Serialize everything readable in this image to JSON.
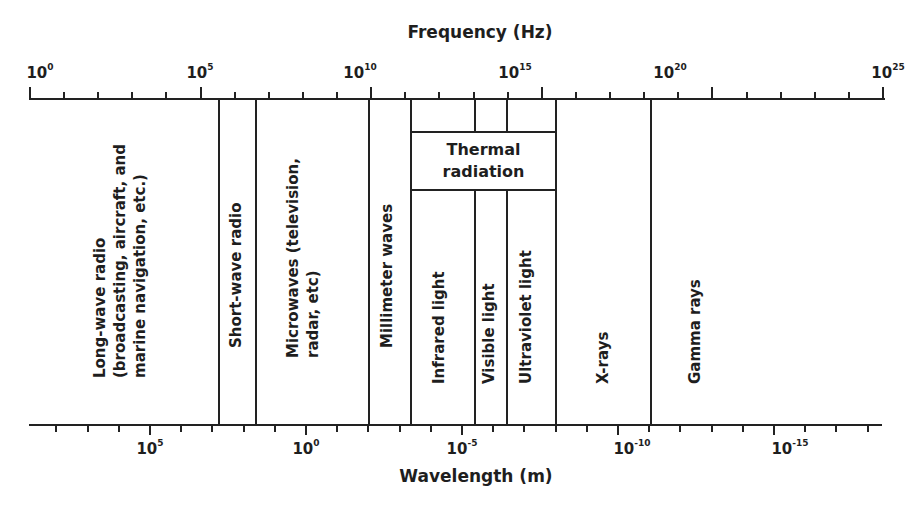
{
  "chart_data": {
    "type": "diagram",
    "top_axis": {
      "label": "Frequency (Hz)",
      "scale": "log10",
      "range": [
        0,
        25
      ],
      "ticks": [
        {
          "base": "10",
          "exp": "0",
          "value": 0
        },
        {
          "base": "10",
          "exp": "5",
          "value": 5
        },
        {
          "base": "10",
          "exp": "10",
          "value": 10
        },
        {
          "base": "10",
          "exp": "15",
          "value": 15
        },
        {
          "base": "10",
          "exp": "20",
          "value": 20
        },
        {
          "base": "10",
          "exp": "25",
          "value": 25
        }
      ]
    },
    "bottom_axis": {
      "label": "Wavelength (m)",
      "scale": "log10",
      "ticks": [
        {
          "base": "10",
          "exp": "5",
          "value": 5
        },
        {
          "base": "10",
          "exp": "0",
          "value": 0
        },
        {
          "base": "10",
          "exp": "-5",
          "value": -5
        },
        {
          "base": "10",
          "exp": "-10",
          "value": -10
        },
        {
          "base": "10",
          "exp": "-15",
          "value": -15
        }
      ]
    },
    "bands": [
      {
        "name": "Long-wave radio",
        "lines": [
          "Long-wave radio",
          "(broadcasting, aircraft, and",
          "marine navigation, etc.)"
        ],
        "freq_log10_range": [
          0,
          5.8
        ]
      },
      {
        "name": "Short-wave radio",
        "lines": [
          "Short-wave radio"
        ],
        "freq_log10_range": [
          5.8,
          6.9
        ]
      },
      {
        "name": "Microwaves",
        "lines": [
          "Microwaves (television,",
          "radar, etc)"
        ],
        "freq_log10_range": [
          6.9,
          10.2
        ]
      },
      {
        "name": "Millimeter waves",
        "lines": [
          "Millimeter waves"
        ],
        "freq_log10_range": [
          10.2,
          11.5
        ]
      },
      {
        "name": "Infrared light",
        "lines": [
          "Infrared light"
        ],
        "freq_log10_range": [
          11.5,
          13.4
        ]
      },
      {
        "name": "Visible light",
        "lines": [
          "Visible light"
        ],
        "freq_log10_range": [
          13.4,
          14.3
        ]
      },
      {
        "name": "Ultraviolet light",
        "lines": [
          "Ultraviolet light"
        ],
        "freq_log10_range": [
          14.3,
          15.8
        ]
      },
      {
        "name": "X-rays",
        "lines": [
          "X-rays"
        ],
        "freq_log10_range": [
          15.8,
          18.6
        ]
      },
      {
        "name": "Gamma rays",
        "lines": [
          "Gamma rays"
        ],
        "freq_log10_range": [
          18.6,
          25
        ]
      }
    ],
    "group": {
      "name": "Thermal radiation",
      "lines": [
        "Thermal",
        "radiation"
      ],
      "spans": [
        "Infrared light",
        "Visible light",
        "Ultraviolet light"
      ]
    }
  },
  "labels": {
    "freq_title": "Frequency (Hz)",
    "wave_title": "Wavelength (m)",
    "thermal_1": "Thermal",
    "thermal_2": "radiation",
    "lw_1": "Long-wave radio",
    "lw_2": "(broadcasting, aircraft, and",
    "lw_3": "marine navigation, etc.)",
    "sw": "Short-wave radio",
    "mw_1": "Microwaves (television,",
    "mw_2": "radar, etc)",
    "mm": "Millimeter waves",
    "ir": "Infrared light",
    "vis": "Visible light",
    "uv": "Ultraviolet light",
    "xr": "X-rays",
    "gr": "Gamma rays"
  },
  "ticks_top": [
    {
      "base": "10",
      "exp": "0"
    },
    {
      "base": "10",
      "exp": "5"
    },
    {
      "base": "10",
      "exp": "10"
    },
    {
      "base": "10",
      "exp": "15"
    },
    {
      "base": "10",
      "exp": "20"
    },
    {
      "base": "10",
      "exp": "25"
    }
  ],
  "ticks_bottom": [
    {
      "base": "10",
      "exp": "5"
    },
    {
      "base": "10",
      "exp": "0"
    },
    {
      "base": "10",
      "exp": "-5"
    },
    {
      "base": "10",
      "exp": "-10"
    },
    {
      "base": "10",
      "exp": "-15"
    }
  ]
}
